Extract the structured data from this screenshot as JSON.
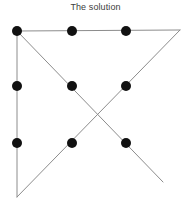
{
  "figure": {
    "title": "The solution",
    "title_color": "#3d3d3d",
    "background_color": "#ffffff",
    "dot_color": "#111111",
    "line_color": "#8c8c8c",
    "dot_radius": 5,
    "line_width": 1,
    "width": 191,
    "height": 209
  },
  "chart_data": {
    "type": "scatter",
    "title": "The solution",
    "xlabel": "",
    "ylabel": "",
    "xlim": [
      0,
      191
    ],
    "ylim": [
      209,
      0
    ],
    "grid": false,
    "legend": "none",
    "annotations": [
      "Nine dots puzzle solution: four connected straight lines through all nine dots, extending outside the 3x3 grid"
    ],
    "series": [
      {
        "name": "dots",
        "type": "scatter",
        "marker": "circle",
        "color": "#111111",
        "size": 10,
        "points": [
          {
            "label": "top-left",
            "x": 17,
            "y": 31
          },
          {
            "label": "top-center",
            "x": 72,
            "y": 31
          },
          {
            "label": "top-right",
            "x": 126,
            "y": 31
          },
          {
            "label": "middle-left",
            "x": 17,
            "y": 86
          },
          {
            "label": "middle-center",
            "x": 72,
            "y": 86
          },
          {
            "label": "middle-right",
            "x": 126,
            "y": 86
          },
          {
            "label": "bottom-left",
            "x": 17,
            "y": 143
          },
          {
            "label": "bottom-center",
            "x": 72,
            "y": 143
          },
          {
            "label": "bottom-right",
            "x": 126,
            "y": 143
          }
        ]
      },
      {
        "name": "solution-path",
        "type": "line",
        "color": "#8c8c8c",
        "width": 1,
        "vertices": [
          {
            "label": "start-top-left",
            "x": 17,
            "y": 31
          },
          {
            "label": "turn-beyond-top-right",
            "x": 180,
            "y": 30
          },
          {
            "label": "turn-bottom-left",
            "x": 17,
            "y": 197
          },
          {
            "label": "turn-top-left",
            "x": 17,
            "y": 31
          },
          {
            "label": "end-beyond-bottom",
            "x": 163,
            "y": 182
          }
        ]
      }
    ]
  }
}
